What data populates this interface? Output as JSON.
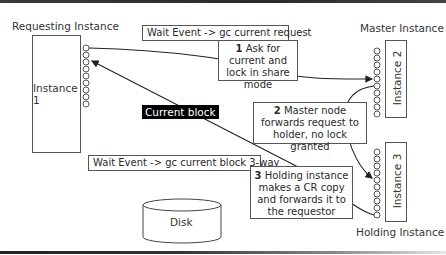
{
  "labels": {
    "requesting_instance": "Requesting Instance",
    "master_instance": "Master Instance",
    "holding_instance": "Holding Instance"
  },
  "instances": [
    {
      "id": "instance-1",
      "label": "Instance 1"
    },
    {
      "id": "instance-2",
      "label": "Instance 2"
    },
    {
      "id": "instance-3",
      "label": "Instance 3"
    }
  ],
  "wait_events": {
    "request": "Wait Event -> gc current request",
    "block": "Wait Event -> gc current block 3-way"
  },
  "steps": [
    {
      "num": "1",
      "text": "Ask for current and lock in share mode"
    },
    {
      "num": "2",
      "text": "Master node forwards request to holder, no lock granted"
    },
    {
      "num": "3",
      "text": "Holding instance makes a CR copy and forwards it to the requestor"
    }
  ],
  "current_block": "Current block",
  "disk": "Disk",
  "colors": {
    "line": "#222222",
    "box_border": "#555555",
    "highlight_bg": "#000000",
    "highlight_fg": "#ffffff"
  }
}
